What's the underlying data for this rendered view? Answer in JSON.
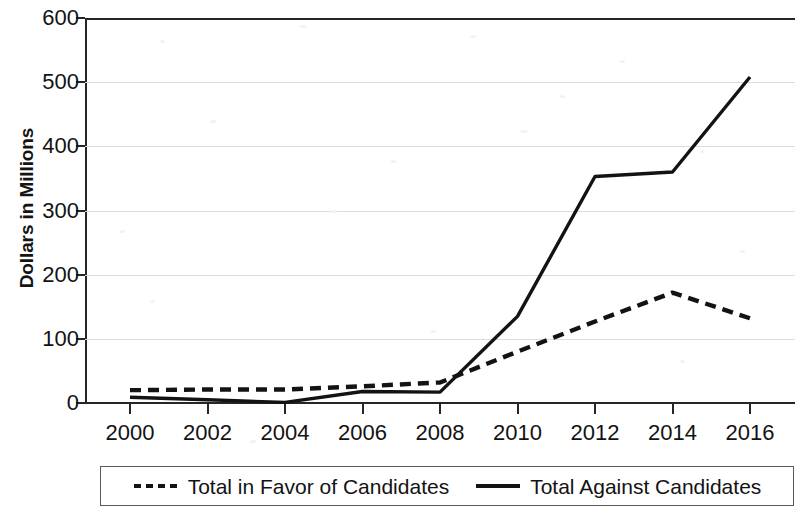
{
  "chart_data": {
    "type": "line",
    "title": "",
    "xlabel": "",
    "ylabel": "Dollars in Millions",
    "x": [
      2000,
      2002,
      2004,
      2006,
      2008,
      2010,
      2012,
      2014,
      2016
    ],
    "categories": [
      "2000",
      "2002",
      "2004",
      "2006",
      "2008",
      "2010",
      "2012",
      "2014",
      "2016"
    ],
    "series": [
      {
        "name": "Total in Favor of Candidates",
        "style": "dashed",
        "color": "#131313",
        "values": [
          20,
          21,
          21,
          26,
          32,
          80,
          127,
          172,
          132
        ]
      },
      {
        "name": "Total Against Candidates",
        "style": "solid",
        "color": "#131313",
        "values": [
          9,
          5,
          1,
          18,
          17,
          135,
          353,
          360,
          508
        ]
      }
    ],
    "ylim": [
      0,
      600
    ],
    "xlim": [
      2000,
      2016
    ],
    "yticks": [
      0,
      100,
      200,
      300,
      400,
      500,
      600
    ],
    "ytick_labels": [
      "0",
      "100",
      "200",
      "300",
      "400",
      "500",
      "600"
    ],
    "xticks": [
      2000,
      2002,
      2004,
      2006,
      2008,
      2010,
      2012,
      2014,
      2016
    ],
    "grid": true,
    "grid_axis": "y",
    "grid_color": "#dcdcdc",
    "legend_position": "below",
    "legend_entries": [
      {
        "label": "Total in Favor of Candidates",
        "style": "dashed"
      },
      {
        "label": "Total Against Candidates",
        "style": "solid"
      }
    ]
  },
  "axis": {
    "y_title": "Dollars in Millions"
  },
  "legend": {
    "favor_label": "Total in Favor of Candidates",
    "against_label": "Total Against Candidates"
  }
}
